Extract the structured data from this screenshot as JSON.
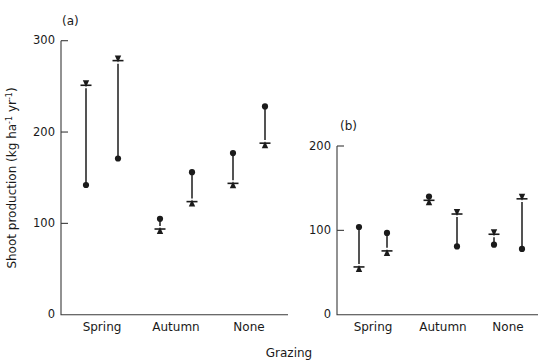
{
  "figure": {
    "xlabel": "Grazing",
    "panel_a_label": "(a)",
    "panel_b_label": "(b)"
  },
  "chart_data": [
    {
      "panel": "(a)",
      "type": "scatter",
      "title": "",
      "xlabel": "Grazing",
      "ylabel": "Shoot production (kg ha⁻¹ yr⁻¹)",
      "ylabel_parts": {
        "main": "Shoot production (kg ha",
        "sup1": "-1",
        "mid": " yr",
        "sup2": "-1",
        "end": ")"
      },
      "categories": [
        "Spring",
        "Autumn",
        "None"
      ],
      "ylim": [
        0,
        300
      ],
      "yticks": [
        0,
        100,
        200,
        300
      ],
      "ytick_labels": [
        "0",
        "100",
        "200",
        "300"
      ],
      "grid": false,
      "legend": "none",
      "series": [
        {
          "name": "replicate 1",
          "points": [
            {
              "category": "Spring",
              "dot": 142,
              "arrow": 249,
              "direction": "up"
            },
            {
              "category": "Autumn",
              "dot": 105,
              "arrow": 96,
              "direction": "down"
            },
            {
              "category": "None",
              "dot": 177,
              "arrow": 146,
              "direction": "down"
            }
          ]
        },
        {
          "name": "replicate 2",
          "points": [
            {
              "category": "Spring",
              "dot": 171,
              "arrow": 276,
              "direction": "up"
            },
            {
              "category": "Autumn",
              "dot": 156,
              "arrow": 126,
              "direction": "down"
            },
            {
              "category": "None",
              "dot": 228,
              "arrow": 190,
              "direction": "down"
            }
          ]
        }
      ]
    },
    {
      "panel": "(b)",
      "type": "scatter",
      "title": "",
      "xlabel": "Grazing",
      "ylabel": "",
      "categories": [
        "Spring",
        "Autumn",
        "None"
      ],
      "ylim": [
        0,
        200
      ],
      "yticks": [
        0,
        100,
        200
      ],
      "ytick_labels": [
        "0",
        "100",
        "200"
      ],
      "grid": false,
      "legend": "none",
      "series": [
        {
          "name": "replicate 1",
          "points": [
            {
              "category": "Spring",
              "dot": 104,
              "arrow": 59,
              "direction": "down"
            },
            {
              "category": "Autumn",
              "dot": 140,
              "arrow": 138,
              "direction": "up"
            },
            {
              "category": "None",
              "dot": 83,
              "arrow": 93,
              "direction": "up"
            }
          ]
        },
        {
          "name": "replicate 2",
          "points": [
            {
              "category": "Spring",
              "dot": 97,
              "arrow": 78,
              "direction": "down"
            },
            {
              "category": "Autumn",
              "dot": 81,
              "arrow": 117,
              "direction": "up"
            },
            {
              "category": "None",
              "dot": 78,
              "arrow": 135,
              "direction": "up"
            }
          ]
        }
      ]
    }
  ]
}
